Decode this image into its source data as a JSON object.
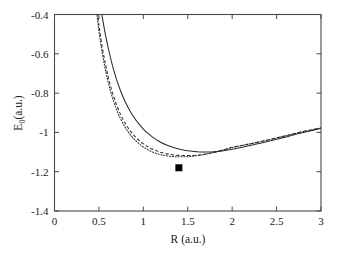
{
  "figure": {
    "background_color": "#ffffff",
    "frame_color": "#4a4a4a",
    "curve_color": "#2b2b2b",
    "marker_color": "#000000"
  },
  "chart_data": {
    "type": "line",
    "title": "",
    "xlabel": "R (a.u.)",
    "ylabel": "E_0 (a.u.)",
    "ylabel_base": "E",
    "ylabel_subscript": "0",
    "ylabel_units": "(a.u.)",
    "xlim": [
      0,
      3
    ],
    "ylim": [
      -1.4,
      -0.4
    ],
    "grid": false,
    "legend": "none",
    "xticks": [
      0,
      0.5,
      1,
      1.5,
      2,
      2.5,
      3
    ],
    "xtick_labels": [
      "0",
      "0.5",
      "1",
      "1.5",
      "2",
      "2.5",
      "3"
    ],
    "yticks": [
      -1.4,
      -1.2,
      -1,
      -0.8,
      -0.6,
      -0.4
    ],
    "ytick_labels": [
      "-1.4",
      "-1.2",
      "-1",
      "-0.8",
      "-0.6",
      "-0.4"
    ],
    "series": [
      {
        "name": "solid-curve",
        "style": "solid",
        "minimum_R": 1.62,
        "minimum_E": -1.1,
        "dissociation_note": "rises toward -0.98 at R = 3",
        "x": [
          0.52,
          0.55,
          0.58,
          0.62,
          0.66,
          0.7,
          0.75,
          0.8,
          0.85,
          0.9,
          0.95,
          1.0,
          1.05,
          1.1,
          1.15,
          1.2,
          1.25,
          1.3,
          1.35,
          1.4,
          1.45,
          1.5,
          1.55,
          1.6,
          1.65,
          1.7,
          1.75,
          1.8,
          1.85,
          1.9,
          1.95,
          2.0,
          2.1,
          2.2,
          2.3,
          2.4,
          2.5,
          2.6,
          2.7,
          2.8,
          2.9,
          3.0
        ],
        "y": [
          -0.36,
          -0.445,
          -0.518,
          -0.601,
          -0.672,
          -0.733,
          -0.796,
          -0.848,
          -0.891,
          -0.927,
          -0.957,
          -0.983,
          -1.004,
          -1.023,
          -1.038,
          -1.051,
          -1.062,
          -1.071,
          -1.078,
          -1.084,
          -1.089,
          -1.093,
          -1.096,
          -1.098,
          -1.0995,
          -1.1,
          -1.0995,
          -1.098,
          -1.096,
          -1.093,
          -1.09,
          -1.086,
          -1.077,
          -1.067,
          -1.057,
          -1.046,
          -1.035,
          -1.024,
          -1.012,
          -1.001,
          -0.99,
          -0.979
        ]
      },
      {
        "name": "dashed-curve",
        "style": "dashed",
        "minimum_R": 1.53,
        "minimum_E": -1.118,
        "dissociation_note": "merges with solid curve beyond R = 2.2",
        "x": [
          0.475,
          0.5,
          0.53,
          0.57,
          0.61,
          0.65,
          0.7,
          0.75,
          0.8,
          0.85,
          0.9,
          0.95,
          1.0,
          1.05,
          1.1,
          1.15,
          1.2,
          1.25,
          1.3,
          1.35,
          1.4,
          1.45,
          1.5,
          1.55,
          1.6,
          1.65,
          1.7,
          1.75,
          1.8,
          1.85,
          1.9,
          1.95,
          2.0,
          2.1,
          2.2,
          2.3,
          2.4,
          2.5,
          2.6,
          2.7,
          2.8,
          2.9,
          3.0
        ],
        "y": [
          -0.36,
          -0.452,
          -0.546,
          -0.645,
          -0.727,
          -0.794,
          -0.862,
          -0.915,
          -0.957,
          -0.991,
          -1.018,
          -1.04,
          -1.058,
          -1.073,
          -1.085,
          -1.094,
          -1.102,
          -1.108,
          -1.112,
          -1.115,
          -1.117,
          -1.1178,
          -1.118,
          -1.1175,
          -1.116,
          -1.1135,
          -1.11,
          -1.1058,
          -1.1008,
          -1.0952,
          -1.0892,
          -1.0828,
          -1.076,
          -1.067,
          -1.058,
          -1.0485,
          -1.0385,
          -1.028,
          -1.0172,
          -1.0062,
          -0.9955,
          -0.9862,
          -0.978
        ]
      },
      {
        "name": "dotted-curve",
        "style": "dotted",
        "minimum_R": 1.5,
        "minimum_E": -1.124,
        "dissociation_note": "merges with solid curve beyond R = 2.2",
        "x": [
          0.47,
          0.49,
          0.52,
          0.56,
          0.6,
          0.64,
          0.69,
          0.74,
          0.79,
          0.84,
          0.89,
          0.94,
          0.99,
          1.04,
          1.09,
          1.14,
          1.19,
          1.24,
          1.29,
          1.34,
          1.39,
          1.44,
          1.49,
          1.54,
          1.59,
          1.64,
          1.69,
          1.74,
          1.79,
          1.84,
          1.89,
          1.94,
          1.99,
          2.1,
          2.2,
          2.3,
          2.4,
          2.5,
          2.6,
          2.7,
          2.8,
          2.9,
          3.0
        ],
        "y": [
          -0.36,
          -0.448,
          -0.548,
          -0.652,
          -0.736,
          -0.805,
          -0.874,
          -0.928,
          -0.97,
          -1.004,
          -1.031,
          -1.053,
          -1.071,
          -1.085,
          -1.097,
          -1.106,
          -1.1127,
          -1.1177,
          -1.1212,
          -1.1234,
          -1.1243,
          -1.1242,
          -1.1235,
          -1.1218,
          -1.1193,
          -1.1162,
          -1.1124,
          -1.1078,
          -1.1026,
          -1.0969,
          -1.0908,
          -1.0843,
          -1.0775,
          -1.0675,
          -1.0585,
          -1.0489,
          -1.0389,
          -1.0284,
          -1.0176,
          -1.0066,
          -0.9958,
          -0.9865,
          -0.978
        ]
      }
    ],
    "markers": [
      {
        "name": "experimental-point",
        "shape": "square",
        "filled": true,
        "x": 1.4,
        "y": -1.18,
        "size_px": 7
      }
    ]
  }
}
